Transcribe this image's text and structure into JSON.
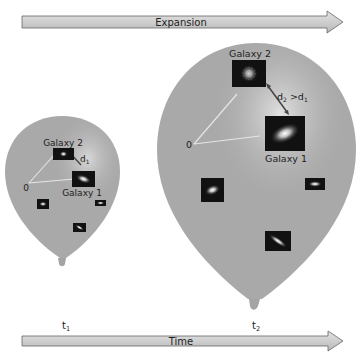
{
  "diagram": {
    "type": "balloon-universe-expansion",
    "colors": {
      "balloon": "#a9a9a9",
      "balloon_highlight": "#d6d6d6",
      "arrow_fill": "#cfcfcf",
      "arrow_stroke": "#666666",
      "galaxy_box": "#111111",
      "distance_line": "#e6e6e6",
      "distance_arrow": "#444444"
    },
    "top_arrow": {
      "label": "Expansion"
    },
    "bottom_arrow": {
      "label": "Time"
    },
    "time_points": [
      {
        "base": "t",
        "sub": "1"
      },
      {
        "base": "t",
        "sub": "2"
      }
    ],
    "balloon_small": {
      "origin_label": "0",
      "galaxy1_label": "Galaxy 1",
      "galaxy2_label": "Galaxy 2",
      "distance_label": {
        "base": "d",
        "sub": "1"
      }
    },
    "balloon_large": {
      "origin_label": "0",
      "galaxy1_label": "Galaxy 1",
      "galaxy2_label": "Galaxy 2",
      "distance_label": {
        "lhs_base": "d",
        "lhs_sub": "2",
        "op": " >",
        "rhs_base": "d",
        "rhs_sub": "1"
      }
    }
  }
}
